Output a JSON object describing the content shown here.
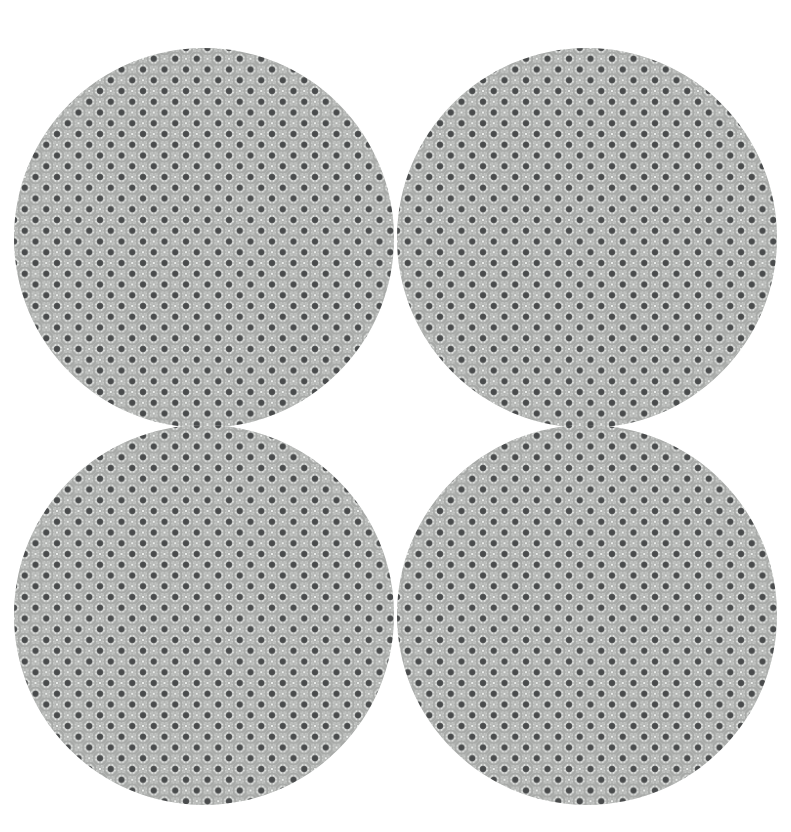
{
  "canvas": {
    "width": 791,
    "height": 832,
    "background_color": "#ffffff",
    "description": "Four circular fabric swatches arranged in a two by two grid on a white background"
  },
  "pattern": {
    "name": "quatrefoil-lattice-damask",
    "tile_size": 21.5,
    "base_color": "#e9ebe9",
    "lattice_color": "#a6a8a6",
    "lattice_light_color": "#c9cbc9",
    "ornament_color": "#b8bab8",
    "dot_color": "#4a4c4d",
    "dot_radius": 3.1,
    "ring_radius": 6.4,
    "cell_color": "#eceeec",
    "hairline_color": "#d8dad8",
    "motif": "dark dot at each lattice node surrounded by a four-lobed ring, connected by diagonal latticework"
  },
  "swatches": [
    {
      "id": "swatch-top-left",
      "label": "Top left swatch",
      "center_x": 204,
      "center_y": 238,
      "radius": 190,
      "pattern_offset_x": 0,
      "pattern_offset_y": 0
    },
    {
      "id": "swatch-top-right",
      "label": "Top right swatch",
      "center_x": 587,
      "center_y": 238,
      "radius": 190,
      "pattern_offset_x": 10.75,
      "pattern_offset_y": 0
    },
    {
      "id": "swatch-bottom-left",
      "label": "Bottom left swatch",
      "center_x": 204,
      "center_y": 615,
      "radius": 190,
      "pattern_offset_x": 0,
      "pattern_offset_y": 10.75
    },
    {
      "id": "swatch-bottom-right",
      "label": "Bottom right swatch",
      "center_x": 587,
      "center_y": 615,
      "radius": 190,
      "pattern_offset_x": 10.75,
      "pattern_offset_y": 10.75
    }
  ]
}
